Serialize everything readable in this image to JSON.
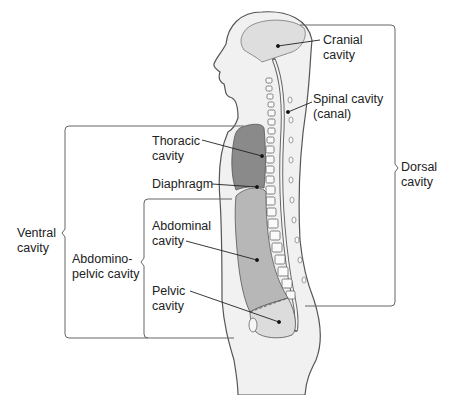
{
  "diagram": {
    "type": "anatomy-sagittal-body-cavities",
    "labels": {
      "cranial": [
        "Cranial",
        "cavity"
      ],
      "spinal": [
        "Spinal cavity",
        "(canal)"
      ],
      "dorsal": [
        "Dorsal",
        "cavity"
      ],
      "thoracic": [
        "Thoracic",
        "cavity"
      ],
      "diaphragm": "Diaphragm",
      "ventral": [
        "Ventral",
        "cavity"
      ],
      "abdominopelvic": [
        "Abdomino-",
        "pelvic cavity"
      ],
      "abdominal": [
        "Abdominal",
        "cavity"
      ],
      "pelvic": [
        "Pelvic",
        "cavity"
      ]
    },
    "colors": {
      "body_fill": "#f1f1f1",
      "body_outline": "#555555",
      "thoracic_fill": "#8a8a8a",
      "abdominal_fill": "#b7b7b7",
      "pelvic_fill": "#dcdcdc",
      "cranial_fill": "#dedede",
      "bracket": "#666666",
      "leader": "#222222"
    }
  }
}
